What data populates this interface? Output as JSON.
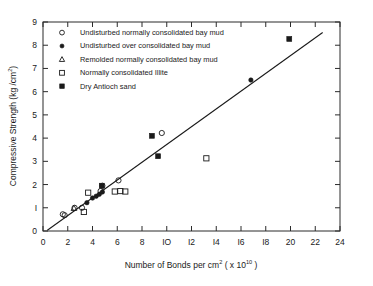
{
  "chart_data": {
    "type": "scatter",
    "title": "",
    "xlabel": "Number of Bonds per cm² (x10¹⁰)",
    "xlabel_parts": {
      "main": "Number  of  Bonds  per  cm",
      "sup1": "2",
      "tail": "( x 10",
      "sup2": "10",
      "close": " )"
    },
    "ylabel": "Compressive  Strength  (kg /cm²)",
    "ylabel_parts": {
      "main": "Compressive  Strength  (kg /cm",
      "sup": "2",
      "close": ")"
    },
    "xlim": [
      0,
      24
    ],
    "ylim": [
      0,
      9
    ],
    "xticks": [
      0,
      2,
      4,
      6,
      8,
      10,
      12,
      14,
      16,
      18,
      20,
      22,
      24
    ],
    "xticklabels": [
      "0",
      "2",
      "4",
      "6",
      "8",
      "IO",
      "I2",
      "I4",
      "I6",
      "I8",
      "20",
      "22",
      "24"
    ],
    "yticks": [
      0,
      1,
      2,
      3,
      4,
      5,
      6,
      7,
      8,
      9
    ],
    "yticklabels": [
      "0",
      "I",
      "2",
      "3",
      "4",
      "5",
      "6",
      "7",
      "8",
      "9"
    ],
    "grid": false,
    "frame": "box",
    "fit_line": {
      "x": [
        0.35,
        22.6
      ],
      "y": [
        0.03,
        8.55
      ],
      "slope": 0.383,
      "intercept": -0.11
    },
    "series": [
      {
        "name": "Undisturbed normally consolidated bay mud",
        "marker": "open-circle",
        "points": [
          [
            1.6,
            0.72
          ],
          [
            1.75,
            0.68
          ],
          [
            2.55,
            1.0
          ],
          [
            3.15,
            1.0
          ],
          [
            4.65,
            1.72
          ],
          [
            4.8,
            1.95
          ],
          [
            6.1,
            2.18
          ],
          [
            9.6,
            4.22
          ]
        ]
      },
      {
        "name": "Undisturbed over consolidated bay mud",
        "marker": "filled-circle",
        "points": [
          [
            3.55,
            1.22
          ],
          [
            4.0,
            1.42
          ],
          [
            4.3,
            1.5
          ],
          [
            4.55,
            1.58
          ],
          [
            4.8,
            1.68
          ],
          [
            16.8,
            6.5
          ]
        ]
      },
      {
        "name": "Remolded normally consolidated bay mud",
        "marker": "open-triangle",
        "points": [
          [
            2.5,
            0.98
          ]
        ]
      },
      {
        "name": "Normally consolidated Illite",
        "marker": "open-square",
        "points": [
          [
            3.3,
            0.82
          ],
          [
            3.65,
            1.65
          ],
          [
            5.8,
            1.7
          ],
          [
            6.25,
            1.72
          ],
          [
            6.65,
            1.7
          ],
          [
            13.2,
            3.13
          ]
        ]
      },
      {
        "name": "Dry Antioch sand",
        "marker": "filled-square",
        "points": [
          [
            4.75,
            1.95
          ],
          [
            8.8,
            4.1
          ],
          [
            9.3,
            3.22
          ],
          [
            19.9,
            8.27
          ]
        ]
      }
    ]
  },
  "legend": {
    "position": "top-left-inside",
    "entries": [
      {
        "marker": "open-circle",
        "label": "Undisturbed  normally  consolidated  bay  mud"
      },
      {
        "marker": "filled-circle",
        "label": "Undisturbed  over  consolidated  bay  mud"
      },
      {
        "marker": "open-triangle",
        "label": "Remolded  normally  consolidated  bay  mud"
      },
      {
        "marker": "open-square",
        "label": "Normally  consolidated  Illite"
      },
      {
        "marker": "filled-square",
        "label": "Dry  Antioch  sand"
      }
    ]
  },
  "colors": {
    "ink": "#1a1a1a",
    "axis": "#2b2b2b",
    "background": "#ffffff"
  }
}
